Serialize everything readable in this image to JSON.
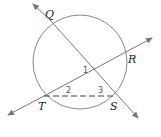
{
  "diagram": {
    "type": "circle-geometry",
    "points": {
      "Q": {
        "label": "Q",
        "x": 50,
        "y": 20
      },
      "R": {
        "label": "R",
        "x": 127,
        "y": 56
      },
      "S": {
        "label": "S",
        "x": 115,
        "y": 96
      },
      "T": {
        "label": "T",
        "x": 44,
        "y": 96
      }
    },
    "angles": [
      {
        "label": "1"
      },
      {
        "label": "2"
      },
      {
        "label": "3"
      }
    ],
    "circle": {
      "cx": 80,
      "cy": 62,
      "r": 47
    },
    "colors": {
      "line": "#777777",
      "text": "#222222",
      "angle_text": "#555555"
    }
  }
}
